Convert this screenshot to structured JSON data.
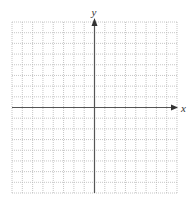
{
  "diagram": {
    "type": "coordinate-grid",
    "x_axis_label": "x",
    "y_axis_label": "y",
    "grid": {
      "columns": 16,
      "rows": 16,
      "columns_left_of_y_axis": 8,
      "rows_above_x_axis": 8,
      "line_style": "dotted"
    },
    "colors": {
      "grid": "#b8b8b8",
      "axis": "#555555",
      "label": "#333333",
      "background": "#ffffff"
    }
  }
}
